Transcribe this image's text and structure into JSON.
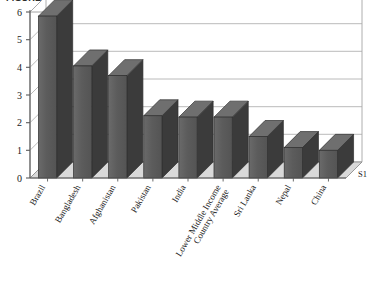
{
  "figure": {
    "title_clipped": "FIGURE 3.2   Average of ...",
    "series_label": "S1"
  },
  "chart_data": {
    "type": "bar",
    "title": "",
    "xlabel": "",
    "ylabel": "",
    "ylim": [
      0,
      6
    ],
    "yticks": [
      "0",
      "1",
      "2",
      "3",
      "4",
      "5",
      "6"
    ],
    "grid": true,
    "legend": "none",
    "three_d": true,
    "bar_color": "#5c5c5c",
    "bar_side_color": "#3b3b3b",
    "bar_top_color": "#6f6f6f",
    "floor_color": "#d9d9d9",
    "categories": [
      "Brazil",
      "Bangladesh",
      "Afghanistan",
      "Pakistan",
      "India",
      "Lower Middle Income Country Average",
      "Sri Lanka",
      "Nepal",
      "China"
    ],
    "category_lines": [
      [
        "Brazil"
      ],
      [
        "Bangladesh"
      ],
      [
        "Afghanistan"
      ],
      [
        "Pakistan"
      ],
      [
        "India"
      ],
      [
        "Lower Middle Income",
        "Country Average"
      ],
      [
        "Sri Lanka"
      ],
      [
        "Nepal"
      ],
      [
        "China"
      ]
    ],
    "values": [
      5.85,
      4.05,
      3.7,
      2.25,
      2.2,
      2.2,
      1.5,
      1.1,
      1.0
    ],
    "series": [
      {
        "name": "S1",
        "values": [
          5.85,
          4.05,
          3.7,
          2.25,
          2.2,
          2.2,
          1.5,
          1.1,
          1.0
        ]
      }
    ]
  }
}
